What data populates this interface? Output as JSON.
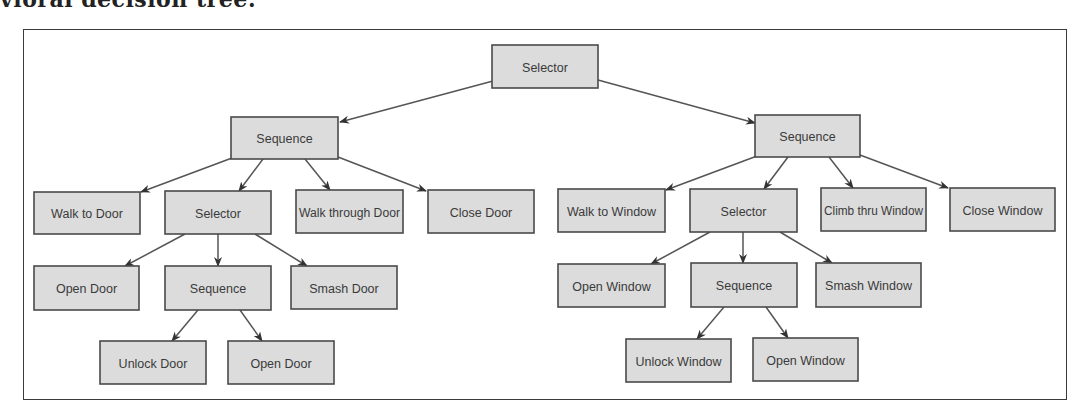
{
  "caption": "vioral decision tree:",
  "colors": {
    "node_fill": "#dcdcdc",
    "node_stroke": "#4a4a4a",
    "edge": "#555555",
    "text": "#3a3a3a"
  },
  "nodes": [
    {
      "id": "root",
      "label": "Selector",
      "x": 492,
      "y": 45,
      "w": 106,
      "h": 43
    },
    {
      "id": "seqL",
      "label": "Sequence",
      "x": 231,
      "y": 117,
      "w": 107,
      "h": 42
    },
    {
      "id": "seqR",
      "label": "Sequence",
      "x": 755,
      "y": 115,
      "w": 105,
      "h": 42
    },
    {
      "id": "walkDoor",
      "label": "Walk to Door",
      "x": 34,
      "y": 192,
      "w": 106,
      "h": 42
    },
    {
      "id": "selL",
      "label": "Selector",
      "x": 165,
      "y": 191,
      "w": 106,
      "h": 43
    },
    {
      "id": "walkThruDoor",
      "label": "Walk through Door",
      "x": 296,
      "y": 190,
      "w": 107,
      "h": 43
    },
    {
      "id": "closeDoor",
      "label": "Close Door",
      "x": 428,
      "y": 190,
      "w": 106,
      "h": 43
    },
    {
      "id": "openDoor1",
      "label": "Open Door",
      "x": 34,
      "y": 266,
      "w": 105,
      "h": 44
    },
    {
      "id": "seqL2",
      "label": "Sequence",
      "x": 165,
      "y": 266,
      "w": 106,
      "h": 44
    },
    {
      "id": "smashDoor",
      "label": "Smash Door",
      "x": 291,
      "y": 266,
      "w": 106,
      "h": 43
    },
    {
      "id": "unlockDoor",
      "label": "Unlock Door",
      "x": 100,
      "y": 341,
      "w": 106,
      "h": 43
    },
    {
      "id": "openDoor2",
      "label": "Open Door",
      "x": 228,
      "y": 341,
      "w": 106,
      "h": 43
    },
    {
      "id": "walkWindow",
      "label": "Walk to Window",
      "x": 558,
      "y": 189,
      "w": 107,
      "h": 43
    },
    {
      "id": "selR",
      "label": "Selector",
      "x": 690,
      "y": 189,
      "w": 107,
      "h": 43
    },
    {
      "id": "climbWindow",
      "label": "Climb thru Window",
      "x": 821,
      "y": 188,
      "w": 105,
      "h": 43
    },
    {
      "id": "closeWindow",
      "label": "Close Window",
      "x": 950,
      "y": 188,
      "w": 105,
      "h": 43
    },
    {
      "id": "openWindow1",
      "label": "Open Window",
      "x": 558,
      "y": 264,
      "w": 107,
      "h": 43
    },
    {
      "id": "seqR2",
      "label": "Sequence",
      "x": 691,
      "y": 263,
      "w": 106,
      "h": 44
    },
    {
      "id": "smashWindow",
      "label": "Smash Window",
      "x": 816,
      "y": 263,
      "w": 105,
      "h": 44
    },
    {
      "id": "unlockWindow",
      "label": "Unlock Window",
      "x": 626,
      "y": 339,
      "w": 105,
      "h": 43
    },
    {
      "id": "openWindow2",
      "label": "Open Window",
      "x": 753,
      "y": 338,
      "w": 105,
      "h": 43
    }
  ],
  "edges": [
    {
      "from": "root",
      "to": "seqL",
      "x1": 493,
      "y1": 81,
      "x2": 340,
      "y2": 122
    },
    {
      "from": "root",
      "to": "seqR",
      "x1": 598,
      "y1": 80,
      "x2": 755,
      "y2": 123
    },
    {
      "from": "seqL",
      "to": "walkDoor",
      "x1": 232,
      "y1": 158,
      "x2": 141,
      "y2": 192
    },
    {
      "from": "seqL",
      "to": "selL",
      "x1": 263,
      "y1": 159,
      "x2": 239,
      "y2": 191
    },
    {
      "from": "seqL",
      "to": "walkThruDoor",
      "x1": 305,
      "y1": 159,
      "x2": 330,
      "y2": 190
    },
    {
      "from": "seqL",
      "to": "closeDoor",
      "x1": 338,
      "y1": 157,
      "x2": 426,
      "y2": 191
    },
    {
      "from": "selL",
      "to": "openDoor1",
      "x1": 185,
      "y1": 234,
      "x2": 125,
      "y2": 266
    },
    {
      "from": "selL",
      "to": "seqL2",
      "x1": 218,
      "y1": 234,
      "x2": 218,
      "y2": 266
    },
    {
      "from": "selL",
      "to": "smashDoor",
      "x1": 255,
      "y1": 234,
      "x2": 307,
      "y2": 266
    },
    {
      "from": "seqL2",
      "to": "unlockDoor",
      "x1": 198,
      "y1": 310,
      "x2": 172,
      "y2": 341
    },
    {
      "from": "seqL2",
      "to": "openDoor2",
      "x1": 240,
      "y1": 310,
      "x2": 262,
      "y2": 341
    },
    {
      "from": "seqR",
      "to": "walkWindow",
      "x1": 757,
      "y1": 156,
      "x2": 666,
      "y2": 190
    },
    {
      "from": "seqR",
      "to": "selR",
      "x1": 788,
      "y1": 157,
      "x2": 764,
      "y2": 189
    },
    {
      "from": "seqR",
      "to": "climbWindow",
      "x1": 829,
      "y1": 157,
      "x2": 853,
      "y2": 188
    },
    {
      "from": "seqR",
      "to": "closeWindow",
      "x1": 860,
      "y1": 155,
      "x2": 948,
      "y2": 188
    },
    {
      "from": "selR",
      "to": "openWindow1",
      "x1": 710,
      "y1": 232,
      "x2": 651,
      "y2": 264
    },
    {
      "from": "selR",
      "to": "seqR2",
      "x1": 743,
      "y1": 232,
      "x2": 743,
      "y2": 263
    },
    {
      "from": "selR",
      "to": "smashWindow",
      "x1": 780,
      "y1": 232,
      "x2": 832,
      "y2": 263
    },
    {
      "from": "seqR2",
      "to": "unlockWindow",
      "x1": 724,
      "y1": 307,
      "x2": 697,
      "y2": 339
    },
    {
      "from": "seqR2",
      "to": "openWindow2",
      "x1": 766,
      "y1": 307,
      "x2": 788,
      "y2": 338
    }
  ]
}
